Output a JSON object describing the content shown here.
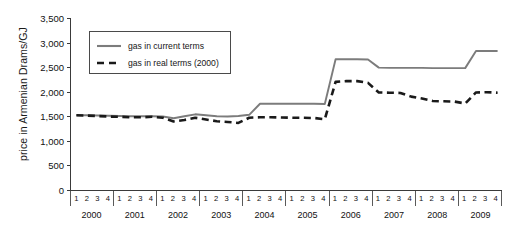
{
  "chart_data": {
    "type": "line",
    "title": "",
    "xlabel": "",
    "ylabel": "price in Armenian Drams/GJ",
    "ylim": [
      0,
      3500
    ],
    "ytick_labels": [
      "3,500",
      "3,000",
      "2,500",
      "2,000",
      "1,500",
      "1,000",
      "500",
      "0"
    ],
    "ytick_values": [
      3500,
      3000,
      2500,
      2000,
      1500,
      1000,
      500,
      0
    ],
    "grid": false,
    "legend_position": "top-left",
    "years": [
      "2000",
      "2001",
      "2002",
      "2003",
      "2004",
      "2005",
      "2006",
      "2007",
      "2008",
      "2009"
    ],
    "quarters": [
      "1",
      "2",
      "3",
      "4"
    ],
    "x": [
      "2000 Q1",
      "2000 Q2",
      "2000 Q3",
      "2000 Q4",
      "2001 Q1",
      "2001 Q2",
      "2001 Q3",
      "2001 Q4",
      "2002 Q1",
      "2002 Q2",
      "2002 Q3",
      "2002 Q4",
      "2003 Q1",
      "2003 Q2",
      "2003 Q3",
      "2003 Q4",
      "2004 Q1",
      "2004 Q2",
      "2004 Q3",
      "2004 Q4",
      "2005 Q1",
      "2005 Q2",
      "2005 Q3",
      "2005 Q4",
      "2006 Q1",
      "2006 Q2",
      "2006 Q3",
      "2006 Q4",
      "2007 Q1",
      "2007 Q2",
      "2007 Q3",
      "2007 Q4",
      "2008 Q1",
      "2008 Q2",
      "2008 Q3",
      "2008 Q4",
      "2009 Q1",
      "2009 Q2",
      "2009 Q3",
      "2009 Q4"
    ],
    "series": [
      {
        "name": "gas in current terms",
        "color": "#7c7c7c",
        "style": "solid",
        "values": [
          1520,
          1520,
          1515,
          1510,
          1505,
          1500,
          1500,
          1500,
          1495,
          1460,
          1500,
          1540,
          1520,
          1500,
          1495,
          1505,
          1530,
          1755,
          1755,
          1755,
          1755,
          1755,
          1755,
          1750,
          2660,
          2660,
          2660,
          2655,
          2490,
          2485,
          2485,
          2485,
          2485,
          2480,
          2480,
          2480,
          2480,
          2830,
          2830,
          2830
        ]
      },
      {
        "name": "gas in real terms (2000)",
        "color": "#1a1a1a",
        "style": "dashed",
        "values": [
          1520,
          1515,
          1505,
          1495,
          1490,
          1480,
          1480,
          1490,
          1470,
          1395,
          1425,
          1470,
          1435,
          1400,
          1385,
          1365,
          1470,
          1480,
          1480,
          1475,
          1470,
          1470,
          1465,
          1440,
          2200,
          2215,
          2215,
          2180,
          1985,
          1980,
          1975,
          1900,
          1860,
          1810,
          1805,
          1800,
          1760,
          1985,
          1990,
          1980
        ]
      }
    ]
  },
  "legend": {
    "items": [
      {
        "label": "gas in current terms"
      },
      {
        "label": "gas in real terms (2000)"
      }
    ]
  }
}
